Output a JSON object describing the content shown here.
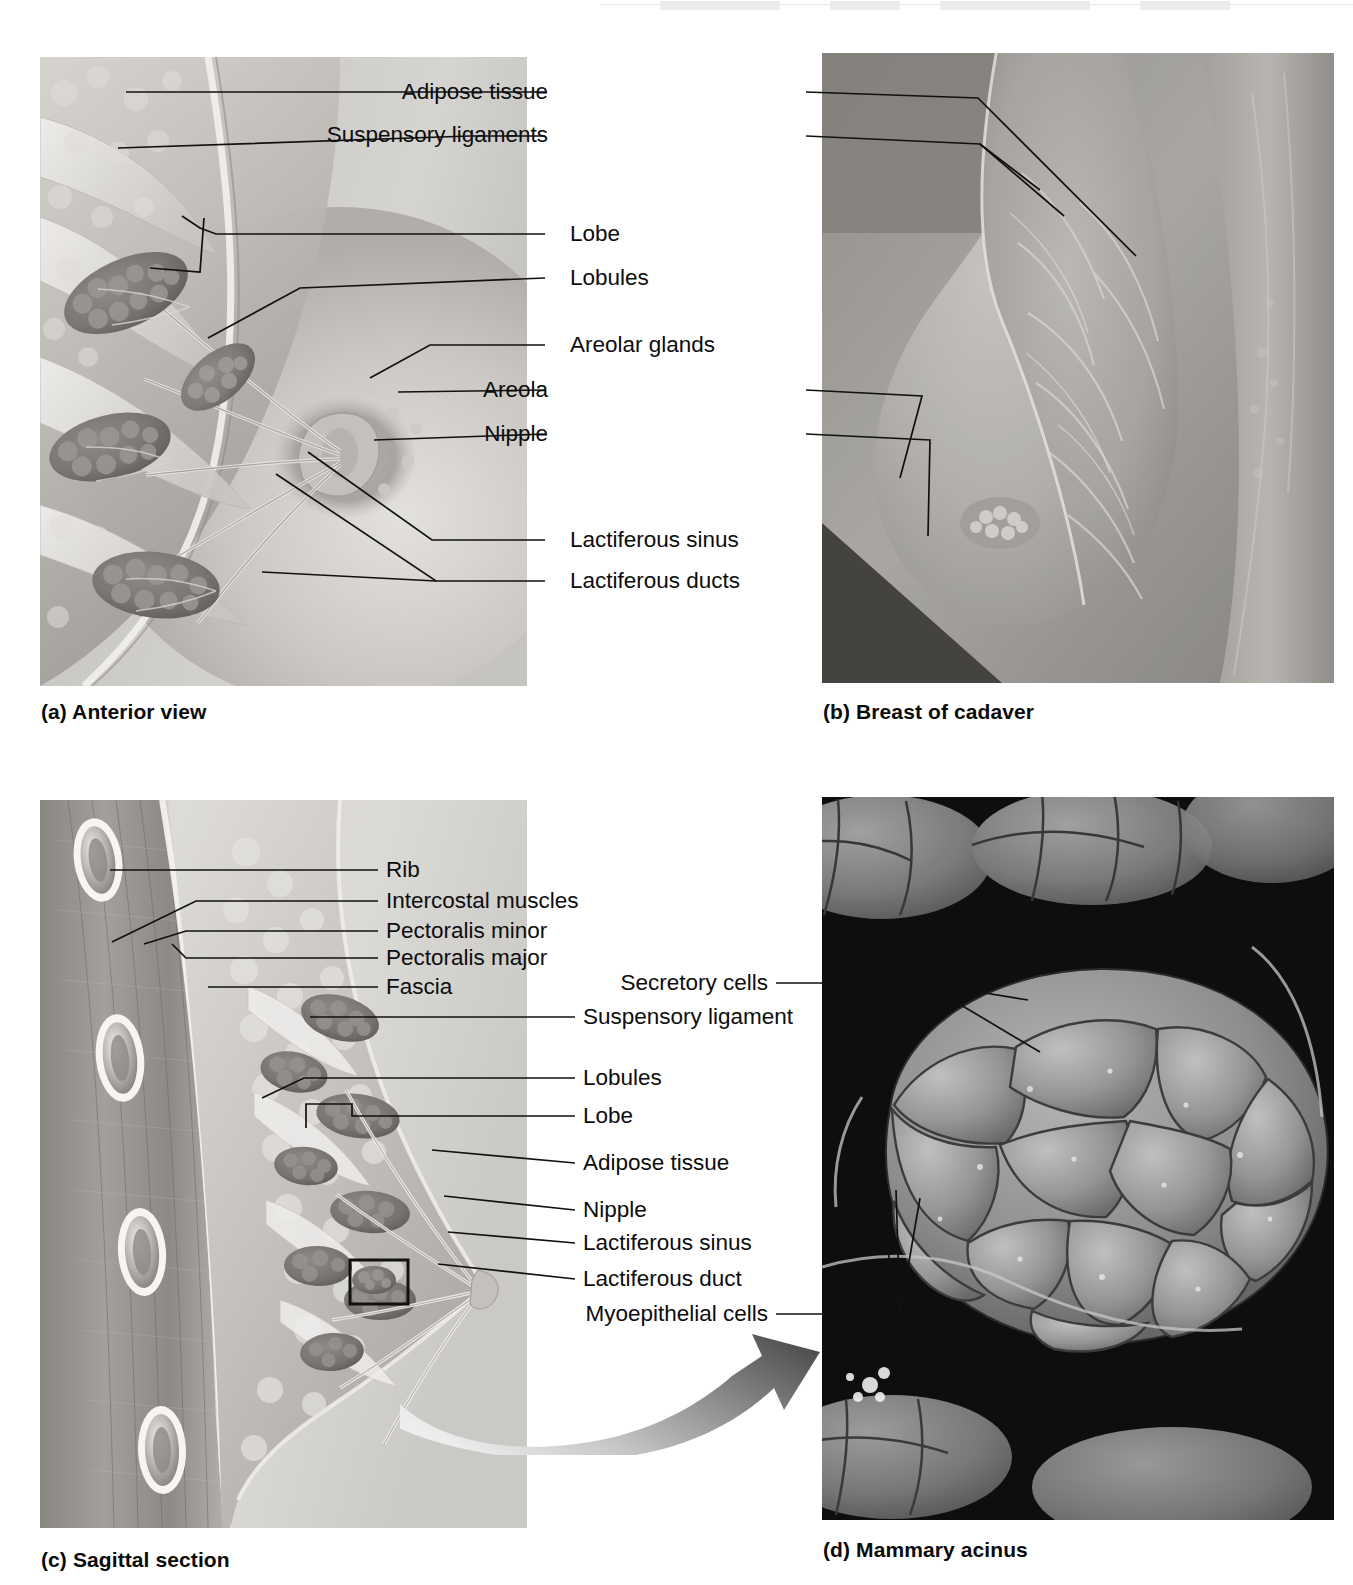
{
  "figure": {
    "background_color": "#ffffff",
    "leader_color": "#111111",
    "text_color": "#0d0d0d"
  },
  "panels": [
    {
      "id": "a",
      "caption": "(a) Anterior view",
      "kind": "illustration",
      "description": "Anterior cut-away view of the breast showing lobes, lobules and duct system"
    },
    {
      "id": "b",
      "caption": "(b) Breast of cadaver",
      "kind": "photograph",
      "description": "Dissected cadaver breast photograph"
    },
    {
      "id": "c",
      "caption": "(c) Sagittal section",
      "kind": "illustration",
      "description": "Sagittal section through chest wall and breast"
    },
    {
      "id": "d",
      "caption": "(d) Mammary acinus",
      "kind": "micrograph",
      "description": "Scanning electron micrograph of a mammary acinus"
    }
  ],
  "labels_a": [
    {
      "text": "Adipose tissue",
      "right_edge": 800,
      "y": 99
    },
    {
      "text": "Suspensory ligaments",
      "right_edge": 800,
      "y": 142
    },
    {
      "text": "Lobe",
      "right_edge": 800,
      "y": 240
    },
    {
      "text": "Lobules",
      "right_edge": 800,
      "y": 285
    },
    {
      "text": "Areolar glands",
      "right_edge": 800,
      "y": 351
    },
    {
      "text": "Areola",
      "right_edge": 800,
      "y": 396
    },
    {
      "text": "Nipple",
      "right_edge": 800,
      "y": 440
    },
    {
      "text": "Lactiferous sinus",
      "right_edge": 800,
      "y": 546
    },
    {
      "text": "Lactiferous ducts",
      "right_edge": 800,
      "y": 587
    }
  ],
  "labels_c": [
    {
      "text": "Rib",
      "x": 386,
      "y": 876
    },
    {
      "text": "Intercostal muscles",
      "x": 386,
      "y": 907
    },
    {
      "text": "Pectoralis minor",
      "x": 386,
      "y": 937
    },
    {
      "text": "Pectoralis major",
      "x": 386,
      "y": 964
    },
    {
      "text": "Fascia",
      "x": 386,
      "y": 993
    },
    {
      "text": "Suspensory ligament",
      "x": 583,
      "y": 1023
    },
    {
      "text": "Lobules",
      "x": 583,
      "y": 1084
    },
    {
      "text": "Lobe",
      "x": 583,
      "y": 1122
    },
    {
      "text": "Adipose tissue",
      "x": 583,
      "y": 1169
    },
    {
      "text": "Nipple",
      "x": 583,
      "y": 1216
    },
    {
      "text": "Lactiferous sinus",
      "x": 583,
      "y": 1249
    },
    {
      "text": "Lactiferous duct",
      "x": 583,
      "y": 1285
    }
  ],
  "labels_d": [
    {
      "text": "Secretory cells",
      "right_edge": 770,
      "y": 989
    },
    {
      "text": "Myoepithelial cells",
      "right_edge": 770,
      "y": 1320
    }
  ],
  "icons": {
    "zoom_arrow": "curved-arrow-icon",
    "callout_box": "callout-box-icon",
    "bracket": "bracket-icon"
  },
  "colors": {
    "illustration_tissue_light": "#d9d6d1",
    "illustration_tissue_mid": "#b3aeaa",
    "illustration_tissue_dark": "#8d8884",
    "illustration_bg": "#cfcdc9",
    "photo_gray": "#a9a6a2",
    "micrograph_dark": "#121212",
    "micrograph_cell": "#9a9a9a",
    "arrow_dark": "#5b5b5b",
    "arrow_light": "#dedede"
  }
}
